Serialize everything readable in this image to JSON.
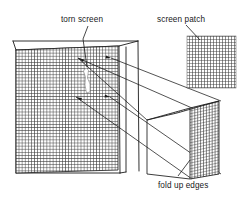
{
  "figure": {
    "background_color": "#ffffff",
    "line_color": "#1a1a1a",
    "mesh_color": "#2b2b2b",
    "tear_color": "#ffffff"
  },
  "labels": {
    "torn_screen": "torn screen",
    "screen_patch": "screen patch",
    "fold_up_edges": "fold up edges"
  },
  "parts": {
    "window_frame": "window-frame",
    "screen_mesh": "screen-mesh",
    "tear": "tear-in-mesh",
    "patch_square": "screen-patch-mesh",
    "folded_patch_box": "folded-patch-3d-box"
  },
  "annotations": {
    "leader_torn_screen": "leader-line-torn-screen",
    "leader_screen_patch": "leader-line-screen-patch",
    "leader_fold_up_edges": "leader-line-fold-up-edges",
    "projection_lines_count": 4
  }
}
